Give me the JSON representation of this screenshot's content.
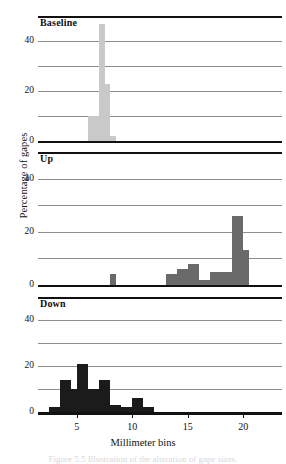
{
  "figure": {
    "xlabel": "Millimeter bins",
    "ylabel": "Percentage of gapes",
    "caption": "Figure 5.5   Illustration of the alteration of gape sizes."
  },
  "axis": {
    "x_ticks": [
      "5",
      "10",
      "15",
      "20"
    ],
    "y_ticks": [
      "0",
      "20",
      "40"
    ]
  },
  "chart_data": {
    "type": "bar",
    "title": "",
    "xlabel": "Millimeter bins",
    "ylabel": "Percentage of gapes",
    "xlim": [
      1.5,
      23.5
    ],
    "ylim": [
      0,
      50
    ],
    "yticks": [
      0,
      20,
      40
    ],
    "gridlines": [
      10,
      20,
      30,
      40
    ],
    "grid": true,
    "legend": "none",
    "bin_width": 0.5,
    "panels": [
      {
        "name": "Baseline",
        "label": "Baseline",
        "color": "#c9c9c9",
        "bins": [
          6.0,
          6.5,
          7.0,
          7.5,
          8.0
        ],
        "values": [
          10,
          10,
          47,
          23,
          2
        ]
      },
      {
        "name": "Up",
        "label": "Up",
        "color": "#6a6a6a",
        "bins": [
          8.0,
          13.0,
          13.5,
          14.0,
          14.5,
          15.0,
          15.5,
          16.0,
          16.5,
          17.0,
          17.5,
          18.0,
          18.5,
          19.0,
          19.5,
          20.0
        ],
        "values": [
          4,
          4,
          4,
          6,
          6,
          8,
          8,
          2,
          2,
          5,
          5,
          5,
          5,
          26,
          26,
          13
        ]
      },
      {
        "name": "Down",
        "label": "Down",
        "color": "#1b1b1b",
        "bins": [
          2.5,
          3.0,
          3.5,
          4.0,
          4.5,
          5.0,
          5.5,
          6.0,
          6.5,
          7.0,
          7.5,
          8.0,
          8.5,
          9.0,
          9.5,
          10.0,
          10.5,
          11.0,
          11.5
        ],
        "values": [
          2,
          2,
          14,
          14,
          10,
          21,
          21,
          10,
          10,
          14,
          14,
          3,
          3,
          2,
          2,
          6,
          6,
          2,
          2
        ]
      }
    ]
  }
}
